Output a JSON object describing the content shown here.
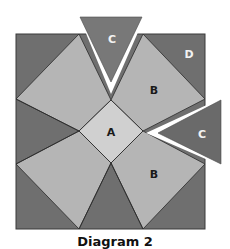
{
  "diagram": {
    "labels": {
      "center": "A",
      "kite_top_right": "B",
      "kite_bottom_right": "B",
      "triangle_top": "C",
      "triangle_right": "C",
      "corner_top_right": "D"
    },
    "caption": "Diagram 2",
    "colors": {
      "background_dark": "#6f6f6f",
      "kite": "#b5b5b5",
      "center": "#d0d0d0",
      "triangle_c": "#787878",
      "outline": "#2a2a2a",
      "label_dark": "#1a1a1a",
      "label_light": "#f2f2f2"
    }
  }
}
